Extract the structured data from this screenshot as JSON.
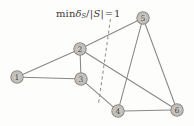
{
  "figure": {
    "kind": "undirected-graph-diagram",
    "width": 194,
    "height": 126,
    "background_color": "#fdfdfc"
  },
  "annotation": {
    "cut_label": {
      "full_text": "min δS/|S| = 1",
      "parts": {
        "min": "min",
        "delta": "δ",
        "delta_subscript": "S",
        "slash": "/",
        "bar_open": "|",
        "set": "S",
        "bar_close": "|",
        "equals": "=",
        "value": "1"
      },
      "x": 56,
      "y": 9,
      "color": "#3d3b39"
    },
    "cut_line": {
      "name": "dashed-cut-line",
      "x1": 110.5,
      "y1": 19.0,
      "x2": 98.5,
      "y2": 104.0,
      "style": "dashed",
      "color": "#9a9792"
    }
  },
  "graph": {
    "node_radius": 6.2,
    "node_fill": "#c9c6c1",
    "node_stroke": "#8e8b86",
    "node_label_color": "#4a4845",
    "edge_color": "#8a8782",
    "nodes": [
      {
        "id": "1",
        "label": "1",
        "x": 17,
        "y": 77
      },
      {
        "id": "2",
        "label": "2",
        "x": 80,
        "y": 49
      },
      {
        "id": "3",
        "label": "3",
        "x": 81,
        "y": 79
      },
      {
        "id": "4",
        "label": "4",
        "x": 118,
        "y": 111
      },
      {
        "id": "5",
        "label": "5",
        "x": 143,
        "y": 18
      },
      {
        "id": "6",
        "label": "6",
        "x": 177,
        "y": 110
      }
    ],
    "edges": [
      {
        "id": "e-1-2",
        "from": "1",
        "to": "2"
      },
      {
        "id": "e-1-3",
        "from": "1",
        "to": "3"
      },
      {
        "id": "e-2-3",
        "from": "2",
        "to": "3"
      },
      {
        "id": "e-2-5",
        "from": "2",
        "to": "5"
      },
      {
        "id": "e-2-6",
        "from": "2",
        "to": "6"
      },
      {
        "id": "e-3-4",
        "from": "3",
        "to": "4"
      },
      {
        "id": "e-4-5",
        "from": "4",
        "to": "5"
      },
      {
        "id": "e-4-6",
        "from": "4",
        "to": "6"
      },
      {
        "id": "e-5-6",
        "from": "5",
        "to": "6"
      }
    ]
  }
}
